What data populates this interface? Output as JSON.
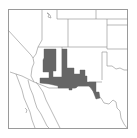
{
  "map": {
    "type": "range-map",
    "region": "Southwestern United States and northern Mexico",
    "colors": {
      "background": "#ffffff",
      "frame": "#9a9a9a",
      "boundary": "#8c8c8c",
      "range_fill": "#666666"
    },
    "shaded_region": "Range area across central/southeastern Arizona and southwestern New Mexico extending to the Texas border"
  }
}
